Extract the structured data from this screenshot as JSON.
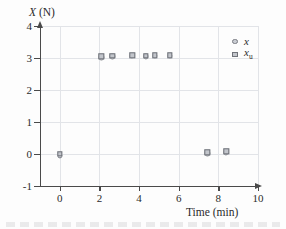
{
  "chart_data": {
    "type": "scatter",
    "title": "",
    "ylabel": "X (N)",
    "ylabel_var": "X",
    "ylabel_unit": "(N)",
    "xlabel": "Time (min)",
    "xlim": [
      -1,
      10
    ],
    "ylim": [
      -1,
      4
    ],
    "xticks": [
      0,
      2,
      4,
      6,
      8,
      10
    ],
    "yticks": [
      4,
      3,
      2,
      1,
      0,
      -1
    ],
    "xtick_labels": [
      "0",
      "2",
      "4",
      "6",
      "8",
      "10"
    ],
    "ytick_labels": [
      "4",
      "3",
      "2",
      "1",
      "0",
      "-1"
    ],
    "grid": true,
    "legend_position": "top-right",
    "series": [
      {
        "name": "x",
        "marker": "circle",
        "points": [
          {
            "x": 0.0,
            "y": -0.05
          },
          {
            "x": 2.1,
            "y": 3.02
          },
          {
            "x": 2.65,
            "y": 3.05
          },
          {
            "x": 3.65,
            "y": 3.07
          },
          {
            "x": 4.35,
            "y": 3.05
          },
          {
            "x": 4.8,
            "y": 3.06
          },
          {
            "x": 5.55,
            "y": 3.07
          },
          {
            "x": 7.45,
            "y": 0.02
          },
          {
            "x": 8.4,
            "y": 0.05
          }
        ]
      },
      {
        "name": "x_u",
        "marker": "square",
        "points": [
          {
            "x": 0.0,
            "y": 0.0
          },
          {
            "x": 2.1,
            "y": 3.05
          },
          {
            "x": 2.65,
            "y": 3.07
          },
          {
            "x": 3.65,
            "y": 3.09
          },
          {
            "x": 4.35,
            "y": 3.07
          },
          {
            "x": 4.8,
            "y": 3.08
          },
          {
            "x": 5.55,
            "y": 3.09
          },
          {
            "x": 7.45,
            "y": 0.05
          },
          {
            "x": 8.4,
            "y": 0.08
          }
        ]
      }
    ]
  },
  "legend": {
    "entries": [
      {
        "label": "x",
        "sub": "",
        "marker": "circle"
      },
      {
        "label": "x",
        "sub": "u",
        "marker": "square"
      }
    ]
  },
  "colors": {
    "axis": "#4a4a4a",
    "grid": "#e2e4e8",
    "marker_fill": "#c9ccd2",
    "marker_edge": "#7a7d84",
    "text": "#2b2b2b",
    "background": "#fdfdfd"
  }
}
